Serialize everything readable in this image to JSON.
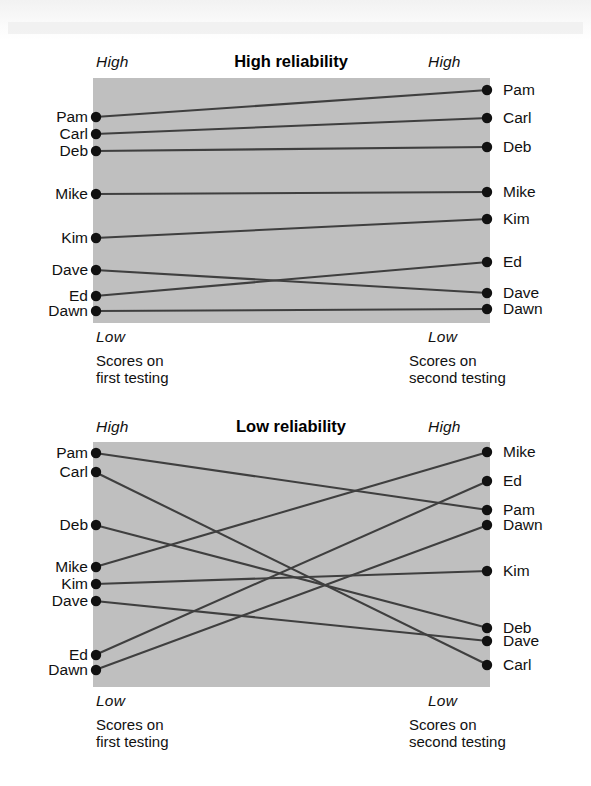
{
  "figure": {
    "background_color": "#ffffff",
    "plot_fill_color": "#bfbfbf",
    "line_color": "#3f3f3f",
    "dot_color": "#111111"
  },
  "panels": [
    {
      "key": "high",
      "title": "High reliability",
      "axis": {
        "left_top": "High",
        "left_bottom": "Low",
        "right_top": "High",
        "right_bottom": "Low"
      },
      "caption_left": "Scores on\nfirst testing",
      "caption_right": "Scores on\nsecond testing",
      "left_names": [
        "Pam",
        "Carl",
        "Deb",
        "Mike",
        "Kim",
        "Dave",
        "Ed",
        "Dawn"
      ],
      "right_names": [
        "Pam",
        "Carl",
        "Deb",
        "Mike",
        "Kim",
        "Ed",
        "Dave",
        "Dawn"
      ]
    },
    {
      "key": "low",
      "title": "Low reliability",
      "axis": {
        "left_top": "High",
        "left_bottom": "Low",
        "right_top": "High",
        "right_bottom": "Low"
      },
      "caption_left": "Scores on\nfirst testing",
      "caption_right": "Scores on\nsecond testing",
      "left_names": [
        "Pam",
        "Carl",
        "Deb",
        "Mike",
        "Kim",
        "Dave",
        "Ed",
        "Dawn"
      ],
      "right_names": [
        "Mike",
        "Ed",
        "Pam",
        "Dawn",
        "Kim",
        "Deb",
        "Dave",
        "Carl"
      ]
    }
  ],
  "chart_data": {
    "type": "line",
    "xlabel": "Testing occasion",
    "ylabel": "Score (Low to High)",
    "x": [
      "Scores on first testing",
      "Scores on second testing"
    ],
    "grid": false,
    "legend": "none",
    "axis_tick_labels": {
      "top": "High",
      "bottom": "Low"
    },
    "panels": [
      {
        "name": "High reliability",
        "series": [
          {
            "name": "Pam",
            "values": [
              84,
              96
            ],
            "first_rank": 1,
            "second_rank": 1
          },
          {
            "name": "Carl",
            "values": [
              78,
              84
            ],
            "first_rank": 2,
            "second_rank": 2
          },
          {
            "name": "Deb",
            "values": [
              71,
              72
            ],
            "first_rank": 3,
            "second_rank": 3
          },
          {
            "name": "Mike",
            "values": [
              52,
              54
            ],
            "first_rank": 4,
            "second_rank": 4
          },
          {
            "name": "Kim",
            "values": [
              34,
              43
            ],
            "first_rank": 5,
            "second_rank": 5
          },
          {
            "name": "Dave",
            "values": [
              23,
              10
            ],
            "first_rank": 6,
            "second_rank": 7
          },
          {
            "name": "Ed",
            "values": [
              10,
              25
            ],
            "first_rank": 7,
            "second_rank": 6
          },
          {
            "name": "Dawn",
            "values": [
              4,
              4
            ],
            "first_rank": 8,
            "second_rank": 8
          }
        ]
      },
      {
        "name": "Low reliability",
        "series": [
          {
            "name": "Pam",
            "values": [
              96,
              72
            ],
            "first_rank": 1,
            "second_rank": 3
          },
          {
            "name": "Carl",
            "values": [
              88,
              4
            ],
            "first_rank": 2,
            "second_rank": 8
          },
          {
            "name": "Deb",
            "values": [
              66,
              16
            ],
            "first_rank": 3,
            "second_rank": 6
          },
          {
            "name": "Mike",
            "values": [
              48,
              96
            ],
            "first_rank": 4,
            "second_rank": 1
          },
          {
            "name": "Kim",
            "values": [
              41,
              47
            ],
            "first_rank": 5,
            "second_rank": 5
          },
          {
            "name": "Dave",
            "values": [
              34,
              10
            ],
            "first_rank": 6,
            "second_rank": 7
          },
          {
            "name": "Ed",
            "values": [
              12,
              84
            ],
            "first_rank": 7,
            "second_rank": 2
          },
          {
            "name": "Dawn",
            "values": [
              4,
              66
            ],
            "first_rank": 8,
            "second_rank": 4
          }
        ]
      }
    ]
  },
  "geometry": {
    "panels": [
      {
        "plot": {
          "x": 93,
          "y": 78,
          "w": 397,
          "h": 245
        },
        "title_center_x": 291,
        "title_y": 52,
        "axis": {
          "left_top_x": 96,
          "left_top_y": 53,
          "left_bottom_x": 96,
          "left_bottom_y": 328,
          "right_top_x": 428,
          "right_top_y": 53,
          "right_bottom_x": 428,
          "right_bottom_y": 328
        },
        "caption_left": {
          "x": 96,
          "y": 352
        },
        "caption_right": {
          "x": 409,
          "y": 352
        },
        "left_points": [
          117,
          134,
          151,
          194,
          238,
          270,
          296,
          311
        ],
        "right_points": [
          90,
          118,
          147,
          192,
          219,
          262,
          293,
          309
        ],
        "left_label_x": 88,
        "right_label_x": 503
      },
      {
        "plot": {
          "x": 93,
          "y": 442,
          "w": 397,
          "h": 245
        },
        "title_center_x": 291,
        "title_y": 417,
        "axis": {
          "left_top_x": 96,
          "left_top_y": 418,
          "left_bottom_x": 96,
          "left_bottom_y": 692,
          "right_top_x": 428,
          "right_top_y": 418,
          "right_bottom_x": 428,
          "right_bottom_y": 692
        },
        "caption_left": {
          "x": 96,
          "y": 716
        },
        "caption_right": {
          "x": 409,
          "y": 716
        },
        "left_points": [
          453,
          472,
          525,
          567,
          584,
          601,
          655,
          670
        ],
        "right_points": [
          452,
          481,
          510,
          525,
          571,
          628,
          641,
          665
        ],
        "left_label_x": 88,
        "right_label_x": 503
      }
    ],
    "connections": [
      {
        "panel": 0,
        "from": 0,
        "to": 0
      },
      {
        "panel": 0,
        "from": 1,
        "to": 1
      },
      {
        "panel": 0,
        "from": 2,
        "to": 2
      },
      {
        "panel": 0,
        "from": 3,
        "to": 3
      },
      {
        "panel": 0,
        "from": 4,
        "to": 4
      },
      {
        "panel": 0,
        "from": 5,
        "to": 6
      },
      {
        "panel": 0,
        "from": 6,
        "to": 5
      },
      {
        "panel": 0,
        "from": 7,
        "to": 7
      },
      {
        "panel": 1,
        "from": 0,
        "to": 2
      },
      {
        "panel": 1,
        "from": 1,
        "to": 7
      },
      {
        "panel": 1,
        "from": 2,
        "to": 5
      },
      {
        "panel": 1,
        "from": 3,
        "to": 0
      },
      {
        "panel": 1,
        "from": 4,
        "to": 4
      },
      {
        "panel": 1,
        "from": 5,
        "to": 6
      },
      {
        "panel": 1,
        "from": 6,
        "to": 1
      },
      {
        "panel": 1,
        "from": 7,
        "to": 3
      }
    ]
  }
}
